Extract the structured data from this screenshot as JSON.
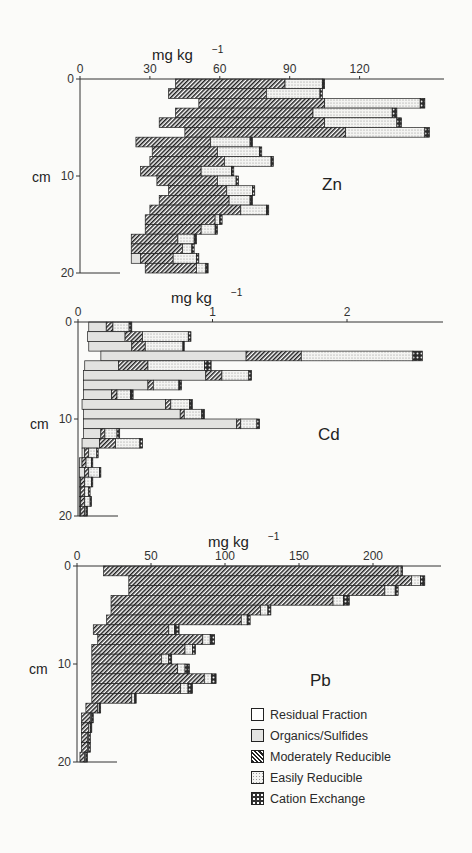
{
  "legend": {
    "items": [
      {
        "key": "residual",
        "label": "Residual Fraction"
      },
      {
        "key": "organics",
        "label": "Organics/Sulfides"
      },
      {
        "key": "moderately_reducible",
        "label": "Moderately Reducible"
      },
      {
        "key": "easily_reducible",
        "label": "Easily Reducible"
      },
      {
        "key": "cation_exchange",
        "label": "Cation Exchange"
      }
    ]
  },
  "chart_data": [
    {
      "type": "bar",
      "orientation": "horizontal-stacked-depth-profile",
      "title": "Zn",
      "xlabel": "mg kg-1",
      "ylabel": "cm",
      "xticks": [
        0,
        30,
        60,
        90,
        120
      ],
      "yticks": [
        0,
        10,
        20
      ],
      "xlim": [
        0,
        155
      ],
      "ylim": [
        0,
        20
      ],
      "depth_intervals_cm": [
        [
          0,
          1
        ],
        [
          1,
          2
        ],
        [
          2,
          3
        ],
        [
          3,
          4
        ],
        [
          4,
          5
        ],
        [
          5,
          6
        ],
        [
          6,
          7
        ],
        [
          7,
          8
        ],
        [
          8,
          9
        ],
        [
          9,
          10
        ],
        [
          10,
          11
        ],
        [
          11,
          12
        ],
        [
          12,
          13
        ],
        [
          13,
          14
        ],
        [
          14,
          15
        ],
        [
          15,
          16
        ],
        [
          16,
          17
        ],
        [
          17,
          18
        ],
        [
          18,
          19
        ],
        [
          19,
          20
        ]
      ],
      "series": [
        {
          "name": "Residual Fraction",
          "values": [
            41,
            38,
            51,
            41,
            34,
            45,
            24,
            31,
            30,
            26,
            33,
            38,
            34,
            30,
            28,
            28,
            22,
            22,
            22,
            28
          ]
        },
        {
          "name": "Organics/Sulfides",
          "values": [
            0,
            0,
            0,
            0,
            0,
            0,
            0,
            0,
            0,
            0,
            0,
            0,
            0,
            0,
            0,
            0,
            0,
            0,
            4,
            0
          ]
        },
        {
          "name": "Moderately Reducible",
          "values": [
            47,
            42,
            54,
            59,
            71,
            69,
            32,
            28,
            32,
            26,
            26,
            25,
            30,
            39,
            30,
            24,
            20,
            22,
            14,
            22
          ]
        },
        {
          "name": "Easily Reducible",
          "values": [
            16,
            23,
            41,
            34,
            31,
            34,
            17,
            18,
            20,
            13,
            8,
            11,
            9,
            11,
            2,
            6,
            7,
            4,
            10,
            4
          ]
        },
        {
          "name": "Cation Exchange",
          "values": [
            1,
            1,
            2,
            2,
            2,
            2,
            1,
            1,
            1,
            1,
            1,
            1,
            1,
            1,
            1,
            1,
            1,
            1,
            1,
            1
          ]
        }
      ]
    },
    {
      "type": "bar",
      "orientation": "horizontal-stacked-depth-profile",
      "title": "Cd",
      "xlabel": "mg kg-1",
      "ylabel": "cm",
      "xticks": [
        0,
        1,
        2
      ],
      "yticks": [
        0,
        10,
        20
      ],
      "xlim": [
        0,
        2.7
      ],
      "ylim": [
        0,
        20
      ],
      "depth_intervals_cm": [
        [
          0,
          1
        ],
        [
          1,
          2
        ],
        [
          2,
          3
        ],
        [
          3,
          4
        ],
        [
          4,
          5
        ],
        [
          5,
          6
        ],
        [
          6,
          7
        ],
        [
          7,
          8
        ],
        [
          8,
          9
        ],
        [
          9,
          10
        ],
        [
          10,
          11
        ],
        [
          11,
          12
        ],
        [
          12,
          13
        ],
        [
          13,
          14
        ],
        [
          14,
          15
        ],
        [
          15,
          16
        ],
        [
          16,
          17
        ],
        [
          17,
          18
        ],
        [
          18,
          19
        ],
        [
          19,
          20
        ]
      ],
      "series": [
        {
          "name": "Residual Fraction",
          "values": [
            0.08,
            0.07,
            0.08,
            0.17,
            0.05,
            0.04,
            0.04,
            0.04,
            0.03,
            0.04,
            0.04,
            0.04,
            0.03,
            0.03,
            0.01,
            0.01,
            0.01,
            0.01,
            0.01,
            0.01
          ]
        },
        {
          "name": "Organics/Sulfides",
          "values": [
            0.13,
            0.28,
            0.32,
            1.08,
            0.25,
            0.91,
            0.48,
            0.21,
            0.62,
            0.72,
            1.14,
            0.13,
            0.13,
            0.02,
            0.02,
            0.04,
            0.01,
            0.01,
            0.01,
            0.01
          ]
        },
        {
          "name": "Moderately Reducible",
          "values": [
            0.05,
            0.13,
            0.1,
            0.41,
            0.22,
            0.12,
            0.04,
            0.04,
            0.04,
            0.03,
            0.03,
            0.03,
            0.12,
            0.03,
            0.03,
            0.03,
            0.03,
            0.03,
            0.03,
            0.03
          ]
        },
        {
          "name": "Easily Reducible",
          "values": [
            0.12,
            0.34,
            0.28,
            0.83,
            0.42,
            0.2,
            0.19,
            0.1,
            0.14,
            0.13,
            0.12,
            0.09,
            0.18,
            0.06,
            0.04,
            0.08,
            0.05,
            0.03,
            0.04,
            0.01
          ]
        },
        {
          "name": "Cation Exchange",
          "values": [
            0.02,
            0.02,
            0.01,
            0.07,
            0.05,
            0.02,
            0.02,
            0.02,
            0.02,
            0.02,
            0.02,
            0.02,
            0.02,
            0.01,
            0.01,
            0.01,
            0.01,
            0.01,
            0.01,
            0.01
          ]
        }
      ]
    },
    {
      "type": "bar",
      "orientation": "horizontal-stacked-depth-profile",
      "title": "Pb",
      "xlabel": "mg kg-1",
      "ylabel": "cm",
      "xticks": [
        0,
        50,
        100,
        150,
        200
      ],
      "yticks": [
        0,
        10,
        20
      ],
      "xlim": [
        0,
        247
      ],
      "ylim": [
        0,
        20
      ],
      "depth_intervals_cm": [
        [
          0,
          1
        ],
        [
          1,
          2
        ],
        [
          2,
          3
        ],
        [
          3,
          4
        ],
        [
          4,
          5
        ],
        [
          5,
          6
        ],
        [
          6,
          7
        ],
        [
          7,
          8
        ],
        [
          8,
          9
        ],
        [
          9,
          10
        ],
        [
          10,
          11
        ],
        [
          11,
          12
        ],
        [
          12,
          13
        ],
        [
          13,
          14
        ],
        [
          14,
          15
        ],
        [
          15,
          16
        ],
        [
          16,
          17
        ],
        [
          17,
          18
        ],
        [
          18,
          19
        ],
        [
          19,
          20
        ]
      ],
      "series": [
        {
          "name": "Residual Fraction",
          "values": [
            18,
            35,
            35,
            23,
            23,
            20,
            11,
            14,
            10,
            10,
            10,
            10,
            10,
            10,
            6,
            3,
            3,
            3,
            3,
            2
          ]
        },
        {
          "name": "Organics/Sulfides",
          "values": [
            0,
            0,
            0,
            0,
            0,
            0,
            0,
            0,
            0,
            0,
            0,
            0,
            0,
            0,
            0,
            0,
            0,
            0,
            0,
            0
          ]
        },
        {
          "name": "Moderately Reducible",
          "values": [
            199,
            191,
            173,
            150,
            101,
            91,
            51,
            71,
            63,
            47,
            58,
            76,
            60,
            27,
            8,
            6,
            5,
            4,
            4,
            3
          ]
        },
        {
          "name": "Easily Reducible",
          "values": [
            2,
            6,
            7,
            7,
            5,
            4,
            4,
            5,
            5,
            5,
            5,
            5,
            5,
            2,
            1,
            1,
            1,
            1,
            1,
            1
          ]
        },
        {
          "name": "Cation Exchange",
          "values": [
            1,
            3,
            2,
            4,
            2,
            2,
            3,
            3,
            2,
            2,
            3,
            3,
            3,
            1,
            1,
            1,
            1,
            1,
            1,
            1
          ]
        }
      ]
    }
  ],
  "panels": [
    {
      "title": "Zn",
      "unit_label": "mg kg",
      "unit_exp": "−1",
      "depth_label": "cm",
      "xticks": [
        "0",
        "30",
        "60",
        "90",
        "120"
      ],
      "yticks": [
        "0",
        "10",
        "20"
      ]
    },
    {
      "title": "Cd",
      "unit_label": "mg kg",
      "unit_exp": "−1",
      "depth_label": "cm",
      "xticks": [
        "0",
        "1",
        "2"
      ],
      "yticks": [
        "0",
        "10",
        "20"
      ]
    },
    {
      "title": "Pb",
      "unit_label": "mg kg",
      "unit_exp": "−1",
      "depth_label": "cm",
      "xticks": [
        "0",
        "50",
        "100",
        "150",
        "200"
      ],
      "yticks": [
        "0",
        "10",
        "20"
      ]
    }
  ]
}
